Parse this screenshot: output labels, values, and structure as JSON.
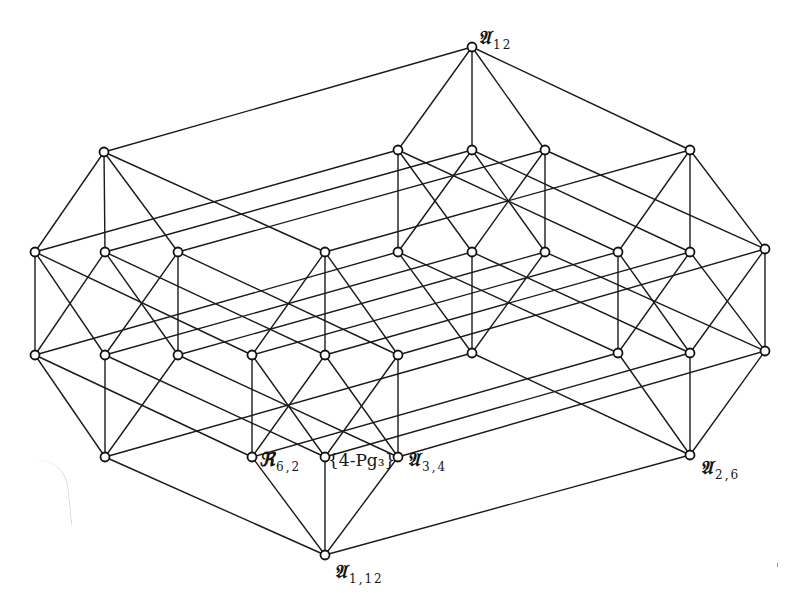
{
  "figure": {
    "type": "lattice-diagram",
    "node_radius": 4.5,
    "colors": {
      "line": "#1a1a1a",
      "node_fill": "#ffffff",
      "node_stroke": "#111111",
      "background": "#ffffff"
    }
  },
  "cube_local_nodes": [
    "b",
    "a1",
    "a2",
    "a3",
    "c1",
    "c2",
    "c3",
    "t"
  ],
  "cube_edges": [
    [
      "b",
      "a1"
    ],
    [
      "b",
      "a2"
    ],
    [
      "b",
      "a3"
    ],
    [
      "a1",
      "c1"
    ],
    [
      "a1",
      "c2"
    ],
    [
      "a2",
      "c1"
    ],
    [
      "a2",
      "c3"
    ],
    [
      "a3",
      "c2"
    ],
    [
      "a3",
      "c3"
    ],
    [
      "c1",
      "t"
    ],
    [
      "c2",
      "t"
    ],
    [
      "c3",
      "t"
    ]
  ],
  "cubes": {
    "MB": {
      "name": "middle-bottom",
      "b": [
        325,
        555
      ],
      "a1": [
        252,
        457
      ],
      "a2": [
        325,
        457
      ],
      "a3": [
        398,
        457
      ],
      "c1": [
        252,
        355
      ],
      "c2": [
        325,
        355
      ],
      "c3": [
        398,
        355
      ],
      "t": [
        325,
        252
      ]
    },
    "L": {
      "name": "left",
      "b": [
        105,
        457
      ],
      "a1": [
        35,
        355
      ],
      "a2": [
        105,
        355
      ],
      "a3": [
        178,
        355
      ],
      "c1": [
        35,
        252
      ],
      "c2": [
        105,
        252
      ],
      "c3": [
        178,
        252
      ],
      "t": [
        104,
        152
      ]
    },
    "R": {
      "name": "right",
      "b": [
        690,
        455
      ],
      "a1": [
        618,
        353
      ],
      "a2": [
        690,
        353
      ],
      "a3": [
        765,
        351
      ],
      "c1": [
        618,
        252
      ],
      "c2": [
        690,
        252
      ],
      "c3": [
        765,
        249
      ],
      "t": [
        690,
        150
      ]
    },
    "MT": {
      "name": "middle-top",
      "b": [
        472,
        353
      ],
      "a1": [
        398,
        252
      ],
      "a2": [
        472,
        252
      ],
      "a3": [
        545,
        252
      ],
      "c1": [
        398,
        150
      ],
      "c2": [
        472,
        150
      ],
      "c3": [
        545,
        150
      ],
      "t": [
        472,
        47
      ]
    }
  },
  "cube_links": [
    [
      "MB",
      "L"
    ],
    [
      "MB",
      "R"
    ],
    [
      "L",
      "MT"
    ],
    [
      "R",
      "MT"
    ]
  ],
  "labels": {
    "top": {
      "main": "𝔄",
      "sub": "12",
      "x": 478,
      "y": 28
    },
    "bottom": {
      "main": "𝔄",
      "sub": "1,12",
      "x": 334,
      "y": 562
    },
    "r62": {
      "main": "ℜ",
      "sub": "6,2",
      "x": 259,
      "y": 450
    },
    "pg": {
      "main": "{4-Pg₃}",
      "x": 328,
      "y": 452
    },
    "a34": {
      "main": "𝔄",
      "sub": "3,4",
      "x": 407,
      "y": 450
    },
    "a26": {
      "main": "𝔄",
      "sub": "2,6",
      "x": 700,
      "y": 458
    }
  }
}
